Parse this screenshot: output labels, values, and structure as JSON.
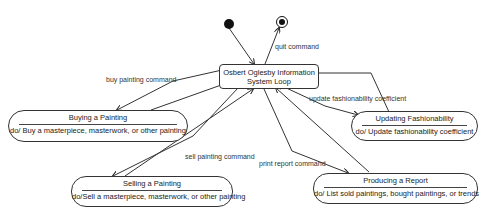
{
  "diagram": {
    "type": "UML state diagram",
    "central_state": {
      "line1": "Osbert Oglesby Information",
      "line2": "System  Loop"
    },
    "pseudostates": {
      "initial": "initial-state",
      "final": "final-state"
    },
    "states": [
      {
        "name": "Buying a Painting",
        "activity": "do/ Buy a masterpiece, masterwork, or other painting"
      },
      {
        "name": "Updating Fashionability",
        "activity": "do/ Update fashionability coefficient"
      },
      {
        "name": "Selling a Painting",
        "activity": "do/Sell  a masterpiece,  masterwork, or other painting"
      },
      {
        "name": "Producing a Report",
        "activity": "do/ List sold paintings, bought paintings, or trends"
      }
    ],
    "transitions": [
      {
        "label": "quit command"
      },
      {
        "label": "buy painting command"
      },
      {
        "label": "update fashionability coefficient"
      },
      {
        "label": "sell painting command"
      },
      {
        "label": "print report command"
      }
    ]
  }
}
